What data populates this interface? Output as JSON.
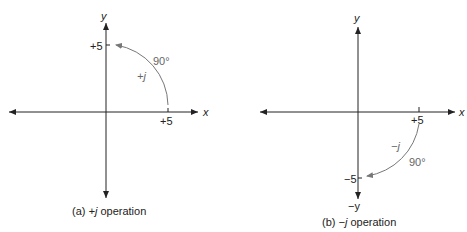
{
  "figure": {
    "panels": [
      {
        "id": "a",
        "caption_prefix": "(a) ",
        "caption_op": "+j",
        "caption_suffix": " operation",
        "x_axis_label": "x",
        "y_axis_label": "y",
        "x_tick_label": "+5",
        "y_tick_label": "+5",
        "arc_label": "+j",
        "angle_label": "90°",
        "rotation": "counterclockwise from +5 on x-axis to +5 on y-axis"
      },
      {
        "id": "b",
        "caption_prefix": "(b) ",
        "caption_op": "−j",
        "caption_suffix": " operation",
        "x_axis_label": "x",
        "y_axis_label": "y",
        "neg_y_axis_label": "−y",
        "x_tick_label": "+5",
        "y_tick_label": "−5",
        "arc_label": "−j",
        "angle_label": "90°",
        "rotation": "clockwise from +5 on x-axis to −5 on y-axis"
      }
    ],
    "colors": {
      "axis": "#222222",
      "arc": "#777777",
      "text": "#222222",
      "muted_text": "#666666"
    }
  }
}
